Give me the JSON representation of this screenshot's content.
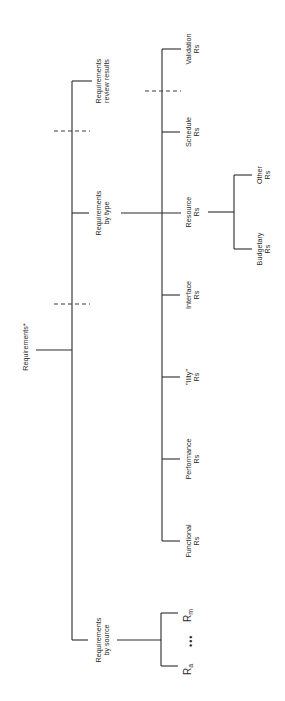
{
  "diagram": {
    "root": {
      "label": "Requirements*"
    },
    "level1": [
      {
        "id": "review",
        "line1": "Requirements",
        "line2": "review results"
      },
      {
        "id": "type",
        "line1": "Requirements",
        "line2": "by type"
      },
      {
        "id": "source",
        "line1": "Requirements",
        "line2": "by source"
      }
    ],
    "by_type": [
      {
        "id": "validation",
        "line1": "Validation",
        "line2": "Rs"
      },
      {
        "id": "schedule",
        "line1": "Schedule",
        "line2": "Rs"
      },
      {
        "id": "resource",
        "line1": "Resource",
        "line2": "Rs"
      },
      {
        "id": "interface",
        "line1": "Interface",
        "line2": "Rs"
      },
      {
        "id": "ility",
        "line1": "\"Ility\"",
        "line2": "Rs"
      },
      {
        "id": "performance",
        "line1": "Performance",
        "line2": "Rs"
      },
      {
        "id": "functional",
        "line1": "Functional",
        "line2": "Rs"
      }
    ],
    "by_resource": [
      {
        "id": "other",
        "line1": "Other",
        "line2": "Rs"
      },
      {
        "id": "budgetary",
        "line1": "Budgetary",
        "line2": "Rs"
      }
    ],
    "by_source": {
      "first": {
        "base": "R",
        "sub": "a"
      },
      "ellipsis": "•••",
      "last": {
        "base": "R",
        "sub": "m"
      }
    }
  }
}
